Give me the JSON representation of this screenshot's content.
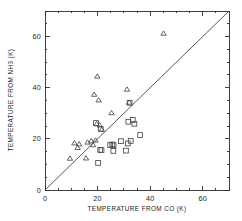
{
  "chart_data": {
    "type": "scatter",
    "title": "",
    "xlabel": "TEMPERATURE FROM CO (K)",
    "ylabel": "TEMPERATURE FROM NH3 (K)",
    "xlim": [
      0,
      70
    ],
    "ylim": [
      0,
      70
    ],
    "xticks": [
      0,
      20,
      40,
      60
    ],
    "yticks": [
      0,
      20,
      40,
      60
    ],
    "xticklabels": [
      "0",
      "20",
      "40",
      "60"
    ],
    "yticklabels": [
      "0",
      "20",
      "40",
      "60"
    ],
    "minor_tick_step": 5,
    "grid": false,
    "legend": "none",
    "annotations": [
      {
        "kind": "reference-line",
        "label": "one-to-one line",
        "from": [
          0,
          0
        ],
        "to": [
          70,
          70
        ]
      }
    ],
    "series": [
      {
        "name": "triangles",
        "marker": "open-triangle",
        "color": "#4a4a4a",
        "points": [
          [
            9.5,
            12.3
          ],
          [
            11.2,
            18.3
          ],
          [
            12.4,
            16.5
          ],
          [
            13.0,
            17.9
          ],
          [
            15.6,
            12.4
          ],
          [
            16.2,
            18.6
          ],
          [
            17.6,
            19.1
          ],
          [
            18.3,
            17.6
          ],
          [
            18.7,
            37.3
          ],
          [
            19.2,
            19.4
          ],
          [
            19.6,
            25.8
          ],
          [
            19.9,
            44.4
          ],
          [
            20.4,
            35.1
          ],
          [
            20.8,
            25.3
          ],
          [
            21.6,
            23.6
          ],
          [
            25.3,
            30.1
          ],
          [
            31.2,
            39.3
          ],
          [
            32.0,
            34.2
          ],
          [
            45.1,
            61.2
          ]
        ]
      },
      {
        "name": "squares",
        "marker": "open-square",
        "color": "#4a4a4a",
        "points": [
          [
            19.4,
            26.2
          ],
          [
            20.2,
            10.6
          ],
          [
            21.0,
            15.7
          ],
          [
            21.5,
            15.6
          ],
          [
            21.2,
            23.9
          ],
          [
            24.8,
            17.6
          ],
          [
            25.6,
            17.8
          ],
          [
            26.1,
            17.5
          ],
          [
            26.0,
            15.3
          ],
          [
            28.9,
            19.1
          ],
          [
            30.8,
            15.4
          ],
          [
            31.5,
            18.2
          ],
          [
            31.7,
            26.7
          ],
          [
            32.2,
            34.1
          ],
          [
            32.6,
            19.2
          ],
          [
            33.4,
            27.4
          ],
          [
            34.0,
            25.9
          ],
          [
            36.2,
            21.5
          ]
        ]
      }
    ]
  }
}
